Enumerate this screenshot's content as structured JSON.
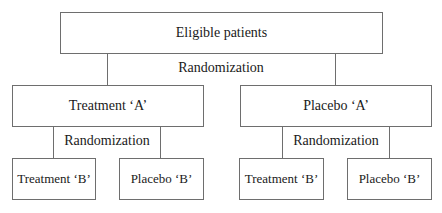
{
  "diagram": {
    "type": "flowchart",
    "root": {
      "label": "Eligible patients"
    },
    "first_randomization": {
      "label": "Randomization"
    },
    "level1": [
      {
        "label": "Treatment ‘A’"
      },
      {
        "label": "Placebo ‘A’"
      }
    ],
    "second_randomization": [
      {
        "label": "Randomization"
      },
      {
        "label": "Randomization"
      }
    ],
    "level2": [
      {
        "label": "Treatment ‘B’"
      },
      {
        "label": "Placebo ‘B’"
      },
      {
        "label": "Treatment ‘B’"
      },
      {
        "label": "Placebo ‘B’"
      }
    ],
    "colors": {
      "line": "#6e6e6e",
      "text": "#1a1a1a",
      "background": "#ffffff"
    }
  }
}
